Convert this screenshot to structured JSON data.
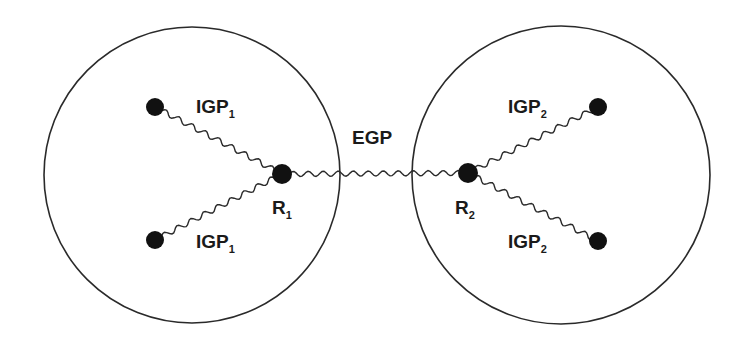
{
  "diagram": {
    "type": "network-routing-domains",
    "colors": {
      "stroke": "#2a2a2a",
      "node": "#111111",
      "background": "#ffffff",
      "text": "#1a1a1a"
    },
    "domains": [
      {
        "id": "as1",
        "cx": 192,
        "cy": 175,
        "r": 148
      },
      {
        "id": "as2",
        "cx": 561,
        "cy": 175,
        "r": 149
      }
    ],
    "nodes": [
      {
        "id": "h1a",
        "x": 155,
        "y": 107,
        "r": 9
      },
      {
        "id": "h1b",
        "x": 155,
        "y": 240,
        "r": 9
      },
      {
        "id": "R1",
        "x": 282,
        "y": 174,
        "r": 10,
        "label": "R",
        "sub": "1",
        "lx": 272,
        "ly": 214
      },
      {
        "id": "R2",
        "x": 468,
        "y": 173,
        "r": 10,
        "label": "R",
        "sub": "2",
        "lx": 455,
        "ly": 214
      },
      {
        "id": "h2a",
        "x": 598,
        "y": 107,
        "r": 9
      },
      {
        "id": "h2b",
        "x": 598,
        "y": 241,
        "r": 9
      }
    ],
    "links": [
      {
        "from": "h1a",
        "to": "R1",
        "protocol": "IGP",
        "sub": "1",
        "lx": 196,
        "ly": 113
      },
      {
        "from": "h1b",
        "to": "R1",
        "protocol": "IGP",
        "sub": "1",
        "lx": 196,
        "ly": 248
      },
      {
        "from": "R1",
        "to": "R2",
        "protocol": "EGP",
        "sub": "",
        "lx": 352,
        "ly": 144
      },
      {
        "from": "R2",
        "to": "h2a",
        "protocol": "IGP",
        "sub": "2",
        "lx": 508,
        "ly": 113
      },
      {
        "from": "R2",
        "to": "h2b",
        "protocol": "IGP",
        "sub": "2",
        "lx": 508,
        "ly": 248
      }
    ]
  }
}
